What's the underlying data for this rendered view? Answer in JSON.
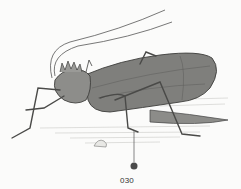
{
  "figure": {
    "label": "030",
    "colors": {
      "background": "#fbfbfa",
      "body": "#7a7a78",
      "body_light": "#a9a9a6",
      "outline": "#3e3e3c",
      "marker": "#4a4a4a"
    }
  }
}
